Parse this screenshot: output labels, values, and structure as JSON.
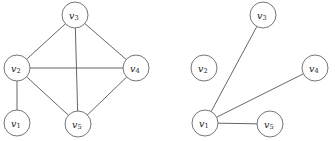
{
  "figure": {
    "background_color": "#ffffff",
    "stroke_color": "#555555",
    "node_fill_color": "#ffffff",
    "node_stroke_color": "#666666",
    "label_color": "#1a1a1a",
    "node_radius": 13
  },
  "graphs": [
    {
      "name": "left-graph",
      "nodes": [
        {
          "id": "v1",
          "base": "v",
          "sub": "1",
          "label": "v1",
          "x": 17,
          "y": 123
        },
        {
          "id": "v2",
          "base": "v",
          "sub": "2",
          "label": "v2",
          "x": 17,
          "y": 68
        },
        {
          "id": "v3",
          "base": "v",
          "sub": "3",
          "label": "v3",
          "x": 75,
          "y": 15
        },
        {
          "id": "v4",
          "base": "v",
          "sub": "4",
          "label": "v4",
          "x": 136,
          "y": 68
        },
        {
          "id": "v5",
          "base": "v",
          "sub": "5",
          "label": "v5",
          "x": 78,
          "y": 124
        }
      ],
      "edges": [
        {
          "from": "v2",
          "to": "v3"
        },
        {
          "from": "v3",
          "to": "v4"
        },
        {
          "from": "v3",
          "to": "v5"
        },
        {
          "from": "v2",
          "to": "v4"
        },
        {
          "from": "v2",
          "to": "v5"
        },
        {
          "from": "v4",
          "to": "v5"
        },
        {
          "from": "v1",
          "to": "v2"
        }
      ]
    },
    {
      "name": "right-graph",
      "nodes": [
        {
          "id": "v1",
          "base": "v",
          "sub": "1",
          "label": "v1",
          "x": 205,
          "y": 123
        },
        {
          "id": "v2",
          "base": "v",
          "sub": "2",
          "label": "v2",
          "x": 204,
          "y": 68
        },
        {
          "id": "v3",
          "base": "v",
          "sub": "3",
          "label": "v3",
          "x": 263,
          "y": 15
        },
        {
          "id": "v4",
          "base": "v",
          "sub": "4",
          "label": "v4",
          "x": 315,
          "y": 68
        },
        {
          "id": "v5",
          "base": "v",
          "sub": "5",
          "label": "v5",
          "x": 270,
          "y": 124
        }
      ],
      "edges": [
        {
          "from": "v1",
          "to": "v3"
        },
        {
          "from": "v1",
          "to": "v4"
        },
        {
          "from": "v1",
          "to": "v5"
        }
      ]
    }
  ]
}
